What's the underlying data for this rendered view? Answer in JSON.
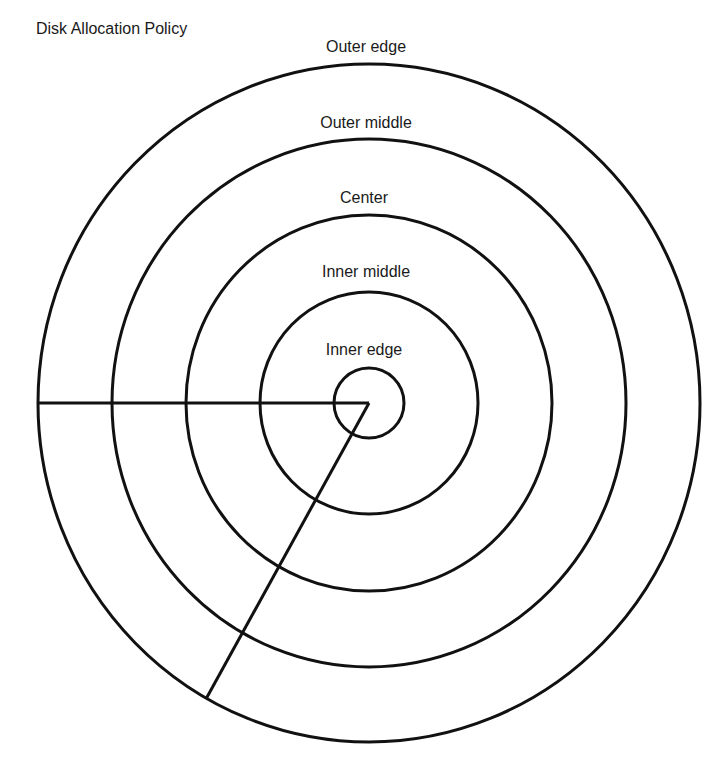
{
  "title": "Disk Allocation Policy",
  "rings": [
    {
      "label": "Outer edge",
      "rx": 331,
      "ry": 339,
      "label_top": 38
    },
    {
      "label": "Outer middle",
      "rx": 257,
      "ry": 264,
      "label_top": 114
    },
    {
      "label": "Center",
      "rx": 183,
      "ry": 188,
      "label_top": 189
    },
    {
      "label": "Inner middle",
      "rx": 109,
      "ry": 111,
      "label_top": 263
    },
    {
      "label": "Inner edge",
      "rx": 35,
      "ry": 35,
      "label_top": 341
    }
  ],
  "center": {
    "x": 369,
    "y": 403
  },
  "stroke_color": "#111111",
  "background": "#ffffff"
}
